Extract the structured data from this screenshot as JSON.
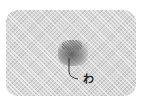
{
  "figure": {
    "swatch": {
      "description": "woven fabric swatch",
      "color": "#d8d8d8"
    },
    "stain": {
      "color": "#505050"
    },
    "label": {
      "text": "わ"
    }
  }
}
